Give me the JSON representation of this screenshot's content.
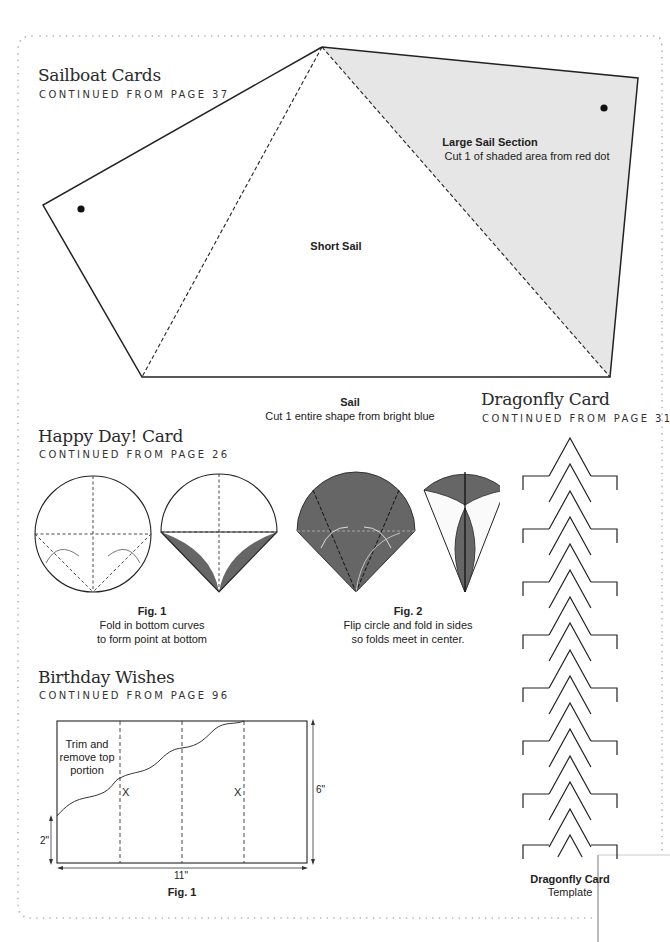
{
  "sailboat": {
    "title": "Sailboat Cards",
    "subtitle": "CONTINUED FROM PAGE 37",
    "large_sail_label": "Large Sail Section",
    "large_sail_note": "Cut 1 of shaded area from red dot",
    "short_sail_label": "Short Sail",
    "sail_label": "Sail",
    "sail_note": "Cut 1 entire shape from bright blue",
    "shade_color": "#e6e6e6"
  },
  "happy_day": {
    "title": "Happy Day! Card",
    "subtitle": "CONTINUED FROM PAGE 26",
    "fig1_label": "Fig. 1",
    "fig1_line1": "Fold in bottom curves",
    "fig1_line2": "to form point at bottom",
    "fig2_label": "Fig. 2",
    "fig2_line1": "Flip circle and fold in sides",
    "fig2_line2": "so folds meet in center.",
    "fold_color": "#666666"
  },
  "birthday": {
    "title": "Birthday Wishes",
    "subtitle": "CONTINUED FROM PAGE 96",
    "trim_line1": "Trim and",
    "trim_line2": "remove top",
    "trim_line3": "portion",
    "x_mark_1": "X",
    "x_mark_2": "X",
    "height_label": "6\"",
    "left_height_label": "2\"",
    "width_label": "11\"",
    "fig_label": "Fig. 1"
  },
  "dragonfly": {
    "title": "Dragonfly Card",
    "subtitle": "CONTINUED FROM PAGE 31",
    "template_label": "Dragonfly Card",
    "template_note": "Template"
  }
}
